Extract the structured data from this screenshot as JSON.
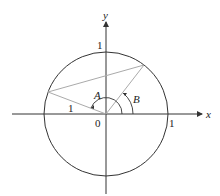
{
  "diagram": {
    "type": "unit-circle",
    "labels": {
      "x_axis": "x",
      "y_axis": "y",
      "origin": "0",
      "x_tick": "1",
      "y_tick": "1",
      "radius_label": "1",
      "angle_a": "A",
      "angle_b": "B"
    },
    "colors": {
      "axes": "#333333",
      "circle": "#333333",
      "chords": "#aaaaaa",
      "text": "#222222"
    }
  }
}
